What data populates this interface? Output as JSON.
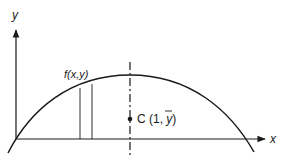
{
  "diagram": {
    "type": "centroid-of-region-under-curve",
    "colors": {
      "stroke": "#1a1a1a",
      "background": "#ffffff"
    },
    "axes": {
      "x_label": "x",
      "y_label": "y"
    },
    "curve": {
      "label": "f(x,y)",
      "description": "downward-opening parabola crossing x-axis at origin and at right"
    },
    "strip": {
      "description": "thin vertical strip under the curve"
    },
    "symmetry_line": {
      "style": "dash-dot",
      "description": "vertical axis of symmetry through curve peak"
    },
    "centroid": {
      "label_prefix": "C (1, ",
      "label_ybar": "y",
      "label_suffix": ")"
    }
  }
}
